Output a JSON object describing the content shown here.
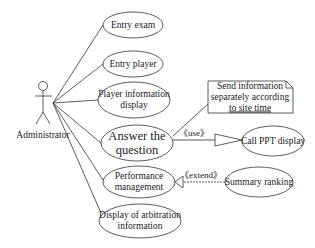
{
  "diagram": {
    "type": "use-case",
    "actor": {
      "name": "Administrator"
    },
    "use_cases": [
      {
        "id": "entry-exam",
        "label": "Entry exam"
      },
      {
        "id": "entry-player",
        "label": "Entry player"
      },
      {
        "id": "player-info",
        "label_line1": "Player information",
        "label_line2": "display"
      },
      {
        "id": "answer",
        "label_line1": "Answer the",
        "label_line2": "question"
      },
      {
        "id": "performance",
        "label_line1": "Performance",
        "label_line2": "management"
      },
      {
        "id": "arbitration",
        "label_line1": "Display of arbitration",
        "label_line2": "information"
      },
      {
        "id": "call-ppt",
        "label": "Call PPT display"
      },
      {
        "id": "summary",
        "label": "Summary ranking"
      }
    ],
    "note": {
      "line1": "Send information",
      "line2": "separately according",
      "line3": "to site time"
    },
    "relations": [
      {
        "from": "answer",
        "to": "call-ppt",
        "stereotype": "《use》"
      },
      {
        "from": "summary",
        "to": "performance",
        "stereotype": "《extend》"
      }
    ]
  }
}
